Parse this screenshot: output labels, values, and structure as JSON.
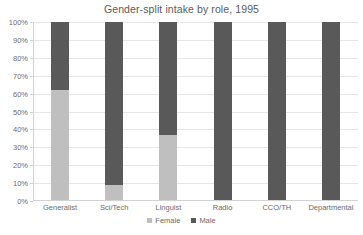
{
  "chart_data": {
    "type": "bar",
    "subtype": "stacked-100-percent",
    "title": "Gender-split intake by role, 1995",
    "xlabel": "",
    "ylabel": "",
    "categories": [
      "Generalist",
      "Sci/Tech",
      "Linguist",
      "Radio",
      "CCO/TH",
      "Departmental"
    ],
    "series": [
      {
        "name": "Female",
        "color": "#bfbfbf",
        "values": [
          62,
          9,
          37,
          0,
          0,
          0
        ]
      },
      {
        "name": "Male",
        "color": "#595959",
        "values": [
          38,
          91,
          63,
          100,
          100,
          100
        ]
      }
    ],
    "ylim": [
      0,
      100
    ],
    "yticks": [
      0,
      10,
      20,
      30,
      40,
      50,
      60,
      70,
      80,
      90,
      100
    ],
    "ytick_labels": [
      "0%",
      "10%",
      "20%",
      "30%",
      "40%",
      "50%",
      "60%",
      "70%",
      "80%",
      "90%",
      "100%"
    ],
    "grid": true,
    "legend_position": "bottom",
    "legend_entries": [
      "Female",
      "Male"
    ],
    "value_unit": "%"
  },
  "style": {
    "background": "#ffffff",
    "gridline_color": "#e6e6e6",
    "axis_color": "#d2d2d2",
    "text_color": "#6b6b6b",
    "title_color": "#5a5a5a"
  }
}
